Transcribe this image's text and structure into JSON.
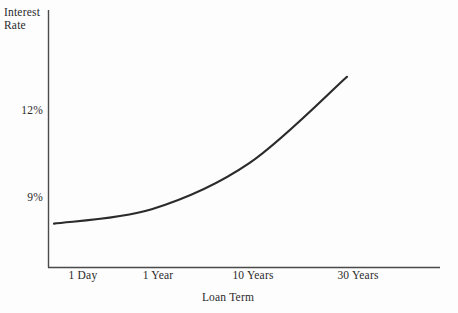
{
  "chart_data": {
    "type": "line",
    "title": "",
    "subtitle": "",
    "xlabel": "Loan Term",
    "ylabel": "Interest Rate",
    "ylabel_lines": [
      "Interest",
      "Rate"
    ],
    "grid": false,
    "legend": "none",
    "annotations": [],
    "x_tick_labels": [
      "1 Day",
      "1 Year",
      "10 Years",
      "30 Years"
    ],
    "y_tick_labels": [
      "12%",
      "9%"
    ],
    "y_tick_values": [
      12,
      9
    ],
    "ylim": [
      7.5,
      14.2
    ],
    "series": [
      {
        "name": "Yield curve",
        "color": "#2b2b2b",
        "x": [
          "1 Day",
          "1 Year",
          "10 Years",
          "30 Years"
        ],
        "points": [
          {
            "x_label": "1 Day",
            "y": 8.1
          },
          {
            "x_label": "1 Year",
            "y": 8.6
          },
          {
            "x_label": "10 Years",
            "y": 10.2
          },
          {
            "x_label": "30 Years",
            "y": 13.2
          }
        ],
        "values": [
          8.1,
          8.6,
          10.2,
          13.2
        ]
      }
    ]
  },
  "axes": {
    "y_title_line1": "Interest",
    "y_title_line2": "Rate",
    "x_title": "Loan Term",
    "y_ticks": [
      {
        "label": "12%"
      },
      {
        "label": "9%"
      }
    ],
    "x_ticks": [
      {
        "label": "1 Day"
      },
      {
        "label": "1 Year"
      },
      {
        "label": "10 Years"
      },
      {
        "label": "30 Years"
      }
    ]
  },
  "colors": {
    "background": "#fdfdfd",
    "axis": "#4a4a4a",
    "curve": "#2b2b2b",
    "text": "#2a2a2a"
  }
}
